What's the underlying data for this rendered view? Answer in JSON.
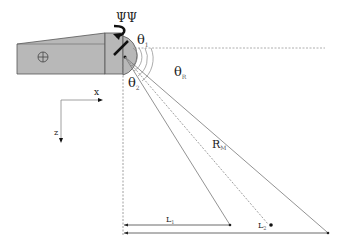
{
  "diagram": {
    "labels": {
      "psi": "ΨΨ",
      "theta1": "θ",
      "theta1_sub": "1",
      "theta2": "θ",
      "theta2_sub": "2",
      "thetaR": "θ",
      "thetaR_sub": "R",
      "range": "R",
      "range_sub": "M",
      "axis_x": "x",
      "axis_z": "z",
      "L1": "L",
      "L1_sub": "1",
      "L2": "L",
      "L2_sub": "2"
    },
    "colors": {
      "housing_fill": "#b8b8b8",
      "housing_stroke": "#555555",
      "line": "#777777",
      "dashed": "#888888",
      "text": "#222222"
    }
  }
}
